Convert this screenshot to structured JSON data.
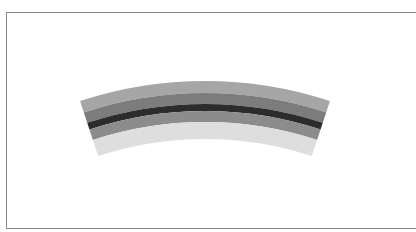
{
  "figure": {
    "center": {
      "x": 205,
      "y": 481
    },
    "start_angle_deg": -18.2,
    "end_angle_deg": 18.2,
    "bands": [
      {
        "name": "outer-light-band",
        "r_outer": 400,
        "r_inner": 388,
        "color": "#a6a6a6"
      },
      {
        "name": "outer-mid-band",
        "r_outer": 388,
        "r_inner": 377,
        "color": "#7c7c7c"
      },
      {
        "name": "core-dark-band",
        "r_outer": 377,
        "r_inner": 370,
        "color": "#2c2c2c"
      },
      {
        "name": "inner-mid-band",
        "r_outer": 370,
        "r_inner": 359,
        "color": "#8c8c8c"
      },
      {
        "name": "inner-pale-band",
        "r_outer": 359,
        "r_inner": 342,
        "color": "#dedede"
      }
    ]
  },
  "frame": {
    "border_color": "#8a8a8a"
  }
}
